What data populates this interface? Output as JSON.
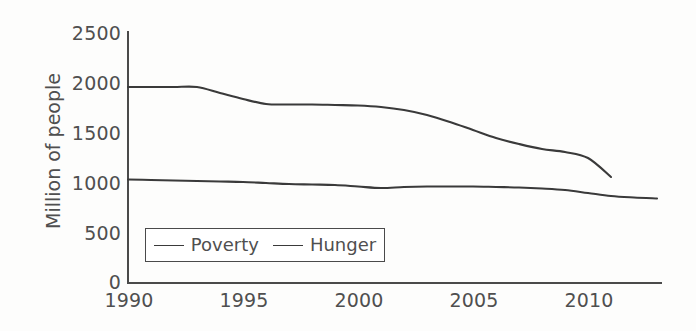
{
  "chart_data": {
    "type": "line",
    "title": "",
    "xlabel": "",
    "ylabel": "Million of people",
    "xlim": [
      1990,
      2013
    ],
    "ylim": [
      0,
      2500
    ],
    "grid": false,
    "legend_position": "lower-left-inside",
    "x_ticks": [
      "1990",
      "1995",
      "2000",
      "2005",
      "2010"
    ],
    "x_tick_values": [
      1990,
      1995,
      2000,
      2005,
      2010
    ],
    "y_ticks": [
      "0",
      "500",
      "1000",
      "1500",
      "2000",
      "2500"
    ],
    "y_tick_values": [
      0,
      500,
      1000,
      1500,
      2000,
      2500
    ],
    "series": [
      {
        "name": "Poverty",
        "color": "#3a3a3a",
        "x": [
          1990,
          1991,
          1992,
          1993,
          1994,
          1995,
          1996,
          1997,
          1998,
          1999,
          2000,
          2001,
          2002,
          2003,
          2004,
          2005,
          2006,
          2007,
          2008,
          2009,
          2010,
          2011
        ],
        "values": [
          1960,
          1960,
          1960,
          1960,
          1900,
          1840,
          1790,
          1785,
          1785,
          1780,
          1775,
          1760,
          1730,
          1680,
          1610,
          1530,
          1450,
          1390,
          1340,
          1310,
          1250,
          1060
        ]
      },
      {
        "name": "Hunger",
        "color": "#3a3a3a",
        "x": [
          1990,
          1991,
          1992,
          1993,
          1994,
          1995,
          1996,
          1997,
          1998,
          1999,
          2000,
          2001,
          2002,
          2003,
          2004,
          2005,
          2006,
          2007,
          2008,
          2009,
          2010,
          2011,
          2012,
          2013
        ],
        "values": [
          1035,
          1030,
          1025,
          1020,
          1015,
          1010,
          1000,
          990,
          985,
          980,
          965,
          950,
          960,
          965,
          965,
          965,
          960,
          955,
          945,
          930,
          900,
          870,
          855,
          845
        ]
      }
    ],
    "legend": [
      "Poverty",
      "Hunger"
    ]
  },
  "legend": {
    "entries": [
      {
        "label": "Poverty"
      },
      {
        "label": "Hunger"
      }
    ]
  }
}
